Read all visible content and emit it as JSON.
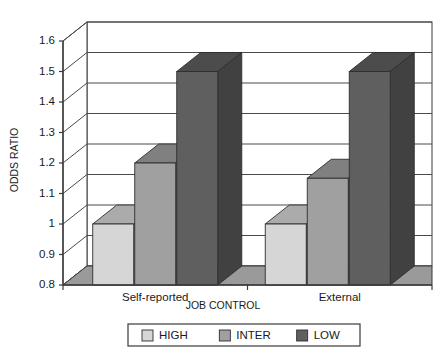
{
  "chart_data": {
    "type": "bar",
    "title": "",
    "subtitle": "",
    "xlabel": "JOB CONTROL",
    "ylabel": "ODDS RATIO",
    "categories": [
      "Self-reported",
      "External"
    ],
    "series": [
      {
        "name": "HIGH",
        "values": [
          1.0,
          1.0
        ],
        "color": "#d6d6d6"
      },
      {
        "name": "INTER",
        "values": [
          1.2,
          1.15
        ],
        "color": "#a0a0a0"
      },
      {
        "name": "LOW",
        "values": [
          1.5,
          1.5
        ],
        "color": "#5f5f5f"
      }
    ],
    "ylim": [
      0.8,
      1.6
    ],
    "ytick_values": [
      0.8,
      0.9,
      1.0,
      1.1,
      1.2,
      1.3,
      1.4,
      1.5,
      1.6
    ],
    "ytick_labels": [
      "0.8",
      "0.9",
      "1",
      "1.1",
      "1.2",
      "1.3",
      "1.4",
      "1.5",
      "1.6"
    ],
    "grid": true,
    "grid_axis": "y",
    "legend_position": "bottom",
    "three_d": true,
    "style": {
      "background": "#ffffff",
      "plot_background": "#ffffff",
      "frame_color": "#3a3a3a",
      "gridline_color": "#4a4a4a",
      "floor_color": "#9a9a9a",
      "side_shade": "#8a8a8a",
      "legend_border": "#3a3a3a",
      "text_color": "#1a1a1a"
    }
  },
  "axis": {
    "y_title": "ODDS RATIO",
    "x_title": "JOB CONTROL",
    "ticks": [
      "1.6",
      "1.5",
      "1.4",
      "1.3",
      "1.2",
      "1.1",
      "1",
      "0.9",
      "0.8"
    ]
  },
  "categories": {
    "first": "Self-reported",
    "second": "External"
  },
  "legend": {
    "items": [
      {
        "label": "HIGH"
      },
      {
        "label": "INTER"
      },
      {
        "label": "LOW"
      }
    ]
  }
}
